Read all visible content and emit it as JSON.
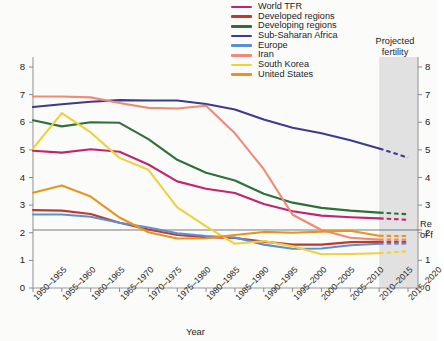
{
  "chart_data": {
    "type": "line",
    "title": "",
    "xlabel": "Year",
    "ylabel": "",
    "ylim": [
      0,
      8
    ],
    "yticks": [
      0,
      1,
      2,
      3,
      4,
      5,
      6,
      7,
      8
    ],
    "right_axis": {
      "ticks": [
        0,
        1,
        2,
        3,
        4,
        5,
        6,
        7,
        8
      ]
    },
    "grid": false,
    "legend_position": "top-center",
    "categories": [
      "1950–1955",
      "1955–1960",
      "1960–1965",
      "1965–1970",
      "1970–1975",
      "1975–1980",
      "1980–1985",
      "1985–1990",
      "1990–1995",
      "1995–2000",
      "2000–2005",
      "2005–2010",
      "2010–2015",
      "2015–2020"
    ],
    "projection": {
      "label_line1": "Projected",
      "label_line2": "fertility",
      "start_category": "2010–2015",
      "end_category": "2015–2020",
      "band_color": "#dcdcdc"
    },
    "reference_line": {
      "value": 2.1,
      "label_line1": "Re",
      "label_line2": "of f",
      "color": "#6b6b6b"
    },
    "series": [
      {
        "name": "World TFR",
        "color": "#c2256e",
        "values": [
          4.97,
          4.9,
          5.02,
          4.93,
          4.47,
          3.86,
          3.59,
          3.44,
          3.04,
          2.78,
          2.62,
          2.56,
          2.52,
          2.47
        ],
        "projected_from": 12
      },
      {
        "name": "Developed regions",
        "color": "#c0392b",
        "values": [
          2.82,
          2.8,
          2.68,
          2.36,
          2.12,
          1.92,
          1.84,
          1.81,
          1.68,
          1.57,
          1.57,
          1.66,
          1.67,
          1.67
        ],
        "projected_from": 12
      },
      {
        "name": "Developing regions",
        "color": "#2f6f3a",
        "values": [
          6.07,
          5.85,
          6.0,
          5.98,
          5.39,
          4.64,
          4.17,
          3.89,
          3.41,
          3.09,
          2.9,
          2.8,
          2.73,
          2.67
        ],
        "projected_from": 12
      },
      {
        "name": "Sub-Saharan Africa",
        "color": "#3b3b8f",
        "values": [
          6.55,
          6.65,
          6.74,
          6.8,
          6.79,
          6.79,
          6.66,
          6.46,
          6.1,
          5.8,
          5.6,
          5.35,
          5.05,
          4.72
        ],
        "projected_from": 12
      },
      {
        "name": "Europe",
        "color": "#5b8fd4",
        "values": [
          2.66,
          2.66,
          2.58,
          2.36,
          2.19,
          1.98,
          1.88,
          1.83,
          1.57,
          1.42,
          1.43,
          1.55,
          1.6,
          1.61
        ],
        "projected_from": 12
      },
      {
        "name": "Iran",
        "color": "#ef8a76",
        "values": [
          6.93,
          6.93,
          6.9,
          6.7,
          6.52,
          6.5,
          6.6,
          5.6,
          4.3,
          2.65,
          2.1,
          1.82,
          1.75,
          1.75
        ],
        "projected_from": 12
      },
      {
        "name": "South Korea",
        "color": "#ecd23e",
        "values": [
          5.05,
          6.33,
          5.63,
          4.71,
          4.28,
          2.92,
          2.23,
          1.6,
          1.7,
          1.51,
          1.22,
          1.23,
          1.26,
          1.33
        ],
        "projected_from": 12
      },
      {
        "name": "United States",
        "color": "#e8941f",
        "values": [
          3.45,
          3.71,
          3.31,
          2.55,
          2.02,
          1.79,
          1.8,
          1.92,
          2.03,
          2.0,
          2.04,
          2.07,
          1.89,
          1.88
        ],
        "projected_from": 12
      }
    ]
  },
  "legend": {
    "items": [
      {
        "label": "World TFR",
        "color": "#c2256e"
      },
      {
        "label": "Developed regions",
        "color": "#c0392b"
      },
      {
        "label": "Developing regions",
        "color": "#2f6f3a"
      },
      {
        "label": "Sub-Saharan Africa",
        "color": "#3b3b8f"
      },
      {
        "label": "Europe",
        "color": "#5b8fd4"
      },
      {
        "label": "Iran",
        "color": "#ef8a76"
      },
      {
        "label": "South Korea",
        "color": "#ecd23e"
      },
      {
        "label": "United States",
        "color": "#e8941f"
      }
    ]
  }
}
